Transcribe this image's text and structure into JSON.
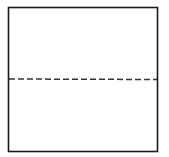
{
  "diagram": {
    "shape": "square",
    "outline_color": "#1a1a1a",
    "fold_line_color": "#333333",
    "square": {
      "x": 8.5,
      "y": 7.5,
      "width": 149,
      "height": 144
    },
    "fold_line": {
      "style": "dashed",
      "y": 79,
      "dash": "6 3"
    }
  }
}
